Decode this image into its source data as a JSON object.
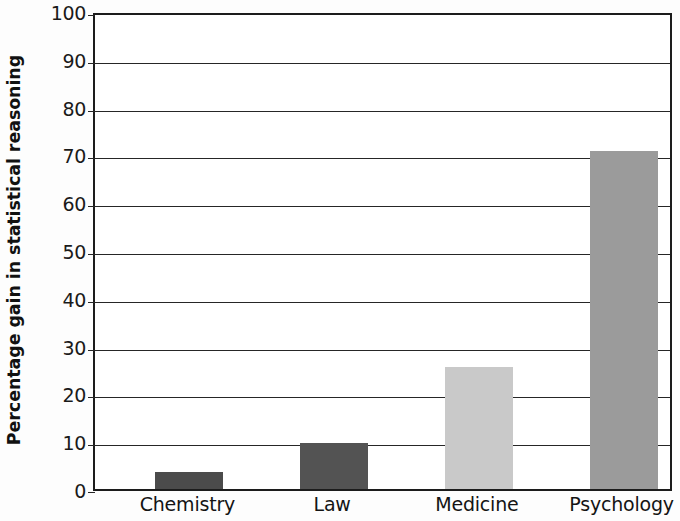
{
  "chart_data": {
    "type": "bar",
    "title": "",
    "subtitle": "",
    "xlabel": "",
    "ylabel": "Percentage gain in statistical reasoning",
    "categories": [
      "Chemistry",
      "Law",
      "Medicine",
      "Psychology"
    ],
    "values": [
      3.5,
      9.7,
      25.5,
      70.8
    ],
    "series": [
      {
        "name": "Percentage gain in statistical reasoning",
        "values": [
          3.5,
          9.7,
          25.5,
          70.8
        ]
      }
    ],
    "ylim": [
      0,
      100
    ],
    "ytick_labels": [
      "0",
      "10",
      "20",
      "30",
      "40",
      "50",
      "60",
      "70",
      "80",
      "90",
      "100"
    ],
    "ytick_values": [
      0,
      10,
      20,
      30,
      40,
      50,
      60,
      70,
      80,
      90,
      100
    ],
    "grid": true,
    "grid_axis": "y",
    "legend": false,
    "legend_position": "none",
    "bar_colors": [
      "#4b4b4b",
      "#535353",
      "#c9c9c9",
      "#9b9b9b"
    ],
    "axis_color": "#1c1c1c",
    "background_color": "#ffffff"
  }
}
